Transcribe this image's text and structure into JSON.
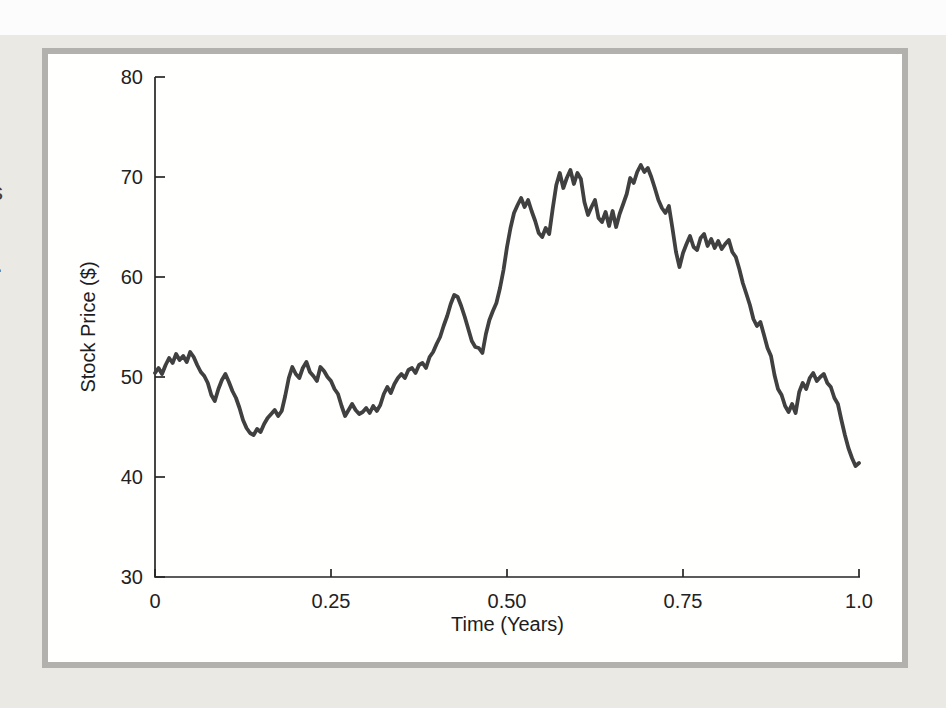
{
  "page": {
    "margin_fragments": {
      "s_fragment": "s",
      "dot_fragment": "."
    }
  },
  "figure": {
    "colors": {
      "page_bg": "#eae9e4",
      "top_band": "#fcfcfc",
      "frame_border": "#b2b1ae",
      "panel_bg": "#fffffe",
      "axis": "#262626"
    }
  },
  "chart_data": {
    "type": "line",
    "title": "",
    "xlabel": "Time (Years)",
    "ylabel": "Stock Price ($)",
    "xlim": [
      0,
      1.0
    ],
    "ylim": [
      30,
      80
    ],
    "grid": false,
    "legend": null,
    "x_ticks": [
      0,
      0.25,
      0.5,
      0.75,
      1.0
    ],
    "x_tick_labels": [
      "0",
      "0.25",
      "0.50",
      "0.75",
      "1.0"
    ],
    "y_ticks": [
      30,
      40,
      50,
      60,
      70,
      80
    ],
    "y_tick_labels": [
      "30",
      "40",
      "50",
      "60",
      "70",
      "80"
    ],
    "series": [
      {
        "name": "simulated-stock-price-path",
        "color": "#404040",
        "t_start": 0,
        "t_step": 0.005,
        "prices": [
          50.4,
          50.9,
          50.3,
          51.2,
          51.9,
          51.4,
          52.3,
          51.7,
          52.1,
          51.5,
          52.5,
          52.0,
          51.2,
          50.5,
          50.1,
          49.4,
          48.2,
          47.6,
          48.8,
          49.7,
          50.3,
          49.5,
          48.6,
          47.9,
          46.9,
          45.7,
          44.9,
          44.4,
          44.2,
          44.8,
          44.5,
          45.3,
          45.9,
          46.3,
          46.7,
          46.1,
          46.6,
          48.1,
          49.9,
          51.0,
          50.3,
          49.9,
          50.9,
          51.5,
          50.5,
          50.1,
          49.6,
          51.0,
          50.6,
          50.0,
          49.6,
          48.8,
          48.3,
          47.1,
          46.1,
          46.7,
          47.3,
          46.7,
          46.3,
          46.5,
          46.9,
          46.4,
          47.1,
          46.6,
          47.2,
          48.3,
          49.0,
          48.4,
          49.3,
          49.9,
          50.3,
          49.9,
          50.7,
          50.9,
          50.4,
          51.2,
          51.4,
          50.9,
          52.0,
          52.5,
          53.3,
          54.0,
          55.1,
          56.1,
          57.3,
          58.2,
          58.0,
          57.1,
          56.0,
          54.8,
          53.6,
          53.0,
          52.9,
          52.4,
          54.3,
          55.7,
          56.6,
          57.4,
          58.9,
          60.7,
          63.0,
          64.9,
          66.4,
          67.2,
          67.9,
          67.0,
          67.7,
          66.6,
          65.6,
          64.4,
          64.0,
          64.9,
          64.3,
          66.9,
          69.2,
          70.4,
          68.9,
          69.9,
          70.7,
          69.3,
          70.4,
          69.8,
          67.5,
          66.2,
          67.0,
          67.7,
          65.9,
          65.5,
          66.5,
          65.1,
          66.6,
          65.0,
          66.3,
          67.3,
          68.3,
          69.9,
          69.4,
          70.5,
          71.2,
          70.5,
          70.9,
          70.0,
          68.9,
          67.7,
          66.9,
          66.4,
          67.1,
          64.9,
          62.5,
          61.0,
          62.4,
          63.3,
          64.1,
          63.0,
          62.7,
          63.9,
          64.3,
          63.1,
          63.8,
          62.9,
          63.6,
          62.8,
          63.3,
          63.7,
          62.5,
          62.0,
          60.8,
          59.4,
          58.3,
          57.2,
          55.8,
          55.1,
          55.5,
          54.2,
          52.9,
          52.1,
          50.2,
          48.8,
          48.2,
          47.1,
          46.5,
          47.3,
          46.4,
          48.5,
          49.4,
          48.8,
          49.9,
          50.4,
          49.6,
          50.0,
          50.3,
          49.4,
          49.0,
          47.9,
          47.3,
          45.7,
          44.2,
          42.9,
          41.9,
          41.1,
          41.4
        ]
      }
    ]
  }
}
